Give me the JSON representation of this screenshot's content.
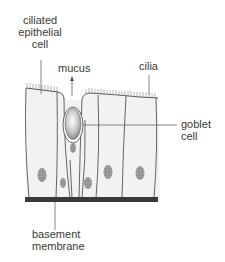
{
  "diagram": {
    "labels": {
      "ciliated_epithelial_cell": [
        "ciliated",
        "epithelial",
        "cell"
      ],
      "mucus": "mucus",
      "cilia": "cilia",
      "goblet_cell": [
        "goblet",
        "cell"
      ],
      "basement_membrane": [
        "basement",
        "membrane"
      ]
    },
    "colors": {
      "outline": "#555555",
      "membrane": "#3a3a3a",
      "cell_fill": "#f2f2f2",
      "nucleus": "#9a9a9a",
      "mucus_fill": "#cfcfcf"
    }
  }
}
